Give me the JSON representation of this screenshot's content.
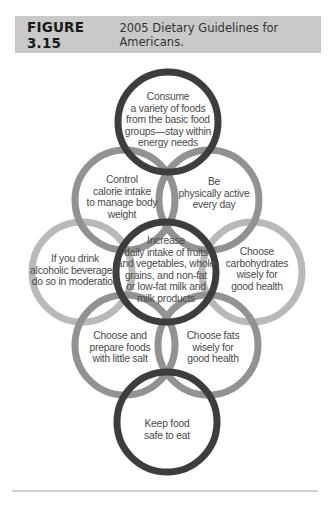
{
  "figure": {
    "number": "FIGURE 3.15",
    "title": "2005 Dietary Guidelines for Americans."
  },
  "colors": {
    "header_bg": "#c9c9c9",
    "ring_dark": "#3d3d3d",
    "ring_medium": "#929292",
    "ring_light": "#b9b9b9",
    "text": "#4a4a4a",
    "rule": "#cfcfcf"
  },
  "circles": [
    {
      "id": "top",
      "label": "Consume\na variety of foods\nfrom the basic food\ngroups—stay within\nenergy needs",
      "shade": "dark"
    },
    {
      "id": "upper-left",
      "label": "Control\ncalorie intake\nto manage body\nweight",
      "shade": "medium"
    },
    {
      "id": "upper-right",
      "label": "Be\nphysically active\nevery day",
      "shade": "medium"
    },
    {
      "id": "left",
      "label": "If you drink\nalcoholic beverages,\ndo so in moderation",
      "shade": "light"
    },
    {
      "id": "center",
      "label": "Increase\ndaily intake of fruits\nand vegetables, whole\ngrains, and non-fat\nor low-fat milk and\nmilk products",
      "shade": "dark"
    },
    {
      "id": "right",
      "label": "Choose\ncarbohydrates\nwisely for\ngood health",
      "shade": "light"
    },
    {
      "id": "lower-left",
      "label": "Choose and\nprepare foods\nwith little salt",
      "shade": "medium"
    },
    {
      "id": "lower-right",
      "label": "Choose fats\nwisely for\ngood health",
      "shade": "medium"
    },
    {
      "id": "bottom",
      "label": "Keep food\nsafe to eat",
      "shade": "dark"
    }
  ]
}
